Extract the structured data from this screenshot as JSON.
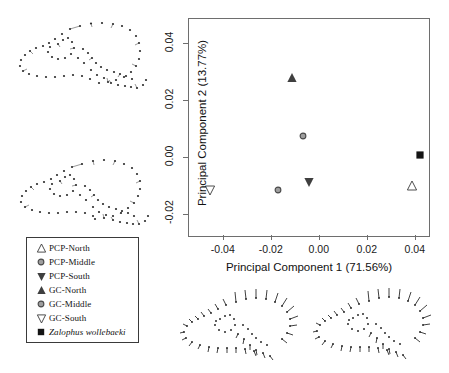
{
  "chart_data": {
    "type": "scatter",
    "title": "",
    "xlabel": "Principal Component 1 (71.56%)",
    "ylabel": "Principal Component 2 (13.77%)",
    "xlim": [
      -0.0545,
      0.0455
    ],
    "ylim": [
      -0.0274,
      0.0486
    ],
    "xticks": [
      -0.04,
      -0.02,
      0.0,
      0.02,
      0.04
    ],
    "xticklabels": [
      "-0.04",
      "-0.02",
      "0.00",
      "0.02",
      "0.04"
    ],
    "yticks": [
      -0.02,
      0.0,
      0.02,
      0.04
    ],
    "yticklabels": [
      "-0.02",
      "0.00",
      "0.02",
      "0.04"
    ],
    "grid": false,
    "legend_position": "outside-lower-left",
    "points": [
      {
        "name": "PCP-North",
        "x": 0.0384,
        "y": -0.01,
        "marker": "triangle-up-open",
        "color": "#333333"
      },
      {
        "name": "PCP-Middle",
        "x": -0.0173,
        "y": -0.0112,
        "marker": "circle-gray",
        "color": "#9a9a9a"
      },
      {
        "name": "PCP-South",
        "x": -0.0047,
        "y": -0.0084,
        "marker": "triangle-down-filled",
        "color": "#333333"
      },
      {
        "name": "GC-North",
        "x": -0.0114,
        "y": 0.028,
        "marker": "triangle-up-filled",
        "color": "#4a4a4a"
      },
      {
        "name": "GC-Middle",
        "x": -0.0071,
        "y": 0.0076,
        "marker": "circle-gray",
        "color": "#9a9a9a"
      },
      {
        "name": "GC-South",
        "x": -0.0459,
        "y": -0.0112,
        "marker": "triangle-down-open",
        "color": "#333333"
      },
      {
        "name": "Zalophus wollebaeki",
        "x": 0.0416,
        "y": 0.0008,
        "marker": "square-filled",
        "color": "#141414"
      }
    ],
    "series": [
      {
        "name": "PCP-North",
        "values": [
          0.0384,
          -0.01
        ]
      },
      {
        "name": "PCP-Middle",
        "values": [
          -0.0173,
          -0.0112
        ]
      },
      {
        "name": "PCP-South",
        "values": [
          -0.0047,
          -0.0084
        ]
      },
      {
        "name": "GC-North",
        "values": [
          -0.0114,
          0.028
        ]
      },
      {
        "name": "GC-Middle",
        "values": [
          -0.0071,
          0.0076
        ]
      },
      {
        "name": "GC-South",
        "values": [
          -0.0459,
          -0.0112
        ]
      },
      {
        "name": "Zalophus wollebaeki",
        "values": [
          0.0416,
          0.0008
        ]
      }
    ]
  },
  "legend": {
    "items": [
      {
        "label": "PCP-North",
        "marker": "triangle-up-open",
        "italic": false
      },
      {
        "label": "PCP-Middle",
        "marker": "circle-gray",
        "italic": false
      },
      {
        "label": "PCP-South",
        "marker": "triangle-down-filled",
        "italic": false
      },
      {
        "label": "GC-North",
        "marker": "triangle-up-filled",
        "italic": false
      },
      {
        "label": "GC-Middle",
        "marker": "circle-gray",
        "italic": false
      },
      {
        "label": "GC-South",
        "marker": "triangle-down-open",
        "italic": false
      },
      {
        "label": "Zalophus wollebaeki",
        "marker": "square-filled",
        "italic": true
      }
    ]
  },
  "shape_diagrams": [
    {
      "name": "skull-landmark-diagram-top-left",
      "position": "top-left"
    },
    {
      "name": "skull-landmark-diagram-middle-left",
      "position": "middle-left"
    },
    {
      "name": "skull-landmark-diagram-bottom-left",
      "position": "bottom-center-left"
    },
    {
      "name": "skull-landmark-diagram-bottom-right",
      "position": "bottom-center-right"
    }
  ]
}
